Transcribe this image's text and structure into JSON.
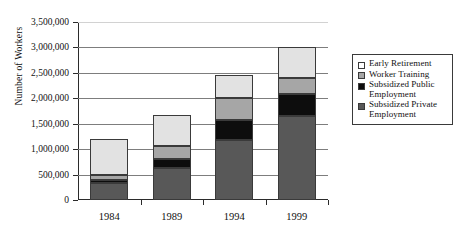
{
  "chart_data": {
    "type": "bar",
    "stacked": true,
    "title": "",
    "xlabel": "",
    "ylabel": "Number of Workers",
    "categories": [
      "1984",
      "1989",
      "1994",
      "1999"
    ],
    "ylim": [
      0,
      3500000
    ],
    "ytick_values": [
      0,
      500000,
      1000000,
      1500000,
      2000000,
      2500000,
      3000000,
      3500000
    ],
    "ytick_labels": [
      "0",
      "500,000",
      "1,000,000",
      "1,500,000",
      "2,000,000",
      "2,500,000",
      "3,000,000",
      "3,500,000"
    ],
    "grid": true,
    "legend_position": "right",
    "series": [
      {
        "name": "Subsidized Private Employment",
        "color": "#585858",
        "values": [
          340000,
          620000,
          1180000,
          1650000
        ]
      },
      {
        "name": "Subsidized Public Employment",
        "color": "#0d0d0d",
        "values": [
          60000,
          180000,
          400000,
          430000
        ]
      },
      {
        "name": "Worker Training",
        "color": "#a6a6a6",
        "values": [
          90000,
          270000,
          420000,
          320000
        ]
      },
      {
        "name": "Early Retirement",
        "color": "#e2e2e2",
        "values": [
          700000,
          600000,
          450000,
          610000
        ]
      }
    ],
    "totals": [
      1190000,
      1670000,
      2450000,
      3010000
    ]
  },
  "legend": {
    "items": [
      {
        "label": "Early Retirement",
        "swatch": "s-early"
      },
      {
        "label": "Worker Training",
        "swatch": "s-training"
      },
      {
        "label": "Subsidized Public\nEmployment",
        "swatch": "s-public"
      },
      {
        "label": "Subsidized Private\nEmployment",
        "swatch": "s-private"
      }
    ]
  }
}
